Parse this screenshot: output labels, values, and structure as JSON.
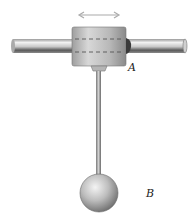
{
  "diagram": {
    "type": "mechanics-figure",
    "labels": {
      "collar": "A",
      "sphere": "B"
    },
    "motion_indicator": "double-headed-arrow",
    "colors": {
      "background": "#ffffff",
      "metal_light": "#d9d9d9",
      "metal_dark": "#6e6e6e",
      "arrow": "#aaaaaa",
      "label": "#222222"
    }
  }
}
